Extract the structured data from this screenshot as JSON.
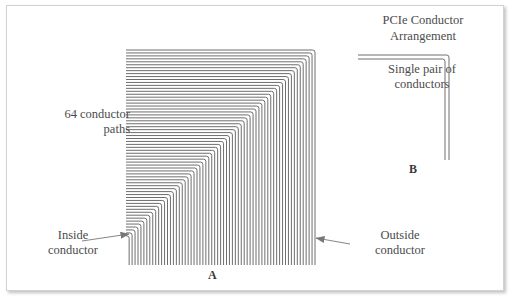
{
  "figure": {
    "width": 518,
    "height": 306,
    "background": "#ffffff",
    "frame_color": "#d2d2d2",
    "trace_color": "#6e6e6e",
    "text_color": "#4b4b4b",
    "label_color": "#3a3a3a"
  },
  "title": {
    "text": "PCIe Conductor\nArrangement"
  },
  "annotations": {
    "conductor_count_note": "64 conductor\npaths",
    "single_pair_note": "Single pair of\nconductors",
    "inside_conductor": "Inside\nconductor",
    "outside_conductor": "Outside\nconductor"
  },
  "reference_labels": {
    "bundle": "A",
    "pair": "B"
  },
  "diagram_data": {
    "type": "technical-drawing",
    "subject": "PCIe differential pair conductor routing",
    "bundle_a": {
      "conductor_count": 64,
      "shape": "nested-L",
      "description": "64 concentric right-angle traces; each runs horizontally then turns 90 degrees downward",
      "horizontal_start_x": 126,
      "top_y": 50,
      "right_x": 315,
      "bottom_y": 265,
      "corner_step": 2.95,
      "trace_width": 1.0
    },
    "bundle_b": {
      "conductor_count": 2,
      "shape": "nested-L",
      "description": "Single differential pair: two concentric right-angle traces",
      "horizontal_start_x": 358,
      "top_y": 55,
      "right_x": 449,
      "bottom_y": 160,
      "corner_step": 4.0,
      "trace_width": 1.0
    },
    "callouts": [
      {
        "label": "Inside\nconductor",
        "arrow_from": [
          82,
          241
        ],
        "arrow_to": [
          129,
          234
        ],
        "direction": "right",
        "points_at": "innermost conductor of bundle A"
      },
      {
        "label": "Outside\nconductor",
        "arrow_from": [
          350,
          244
        ],
        "arrow_to": [
          316,
          238
        ],
        "direction": "left",
        "points_at": "outermost conductor of bundle A"
      }
    ]
  }
}
